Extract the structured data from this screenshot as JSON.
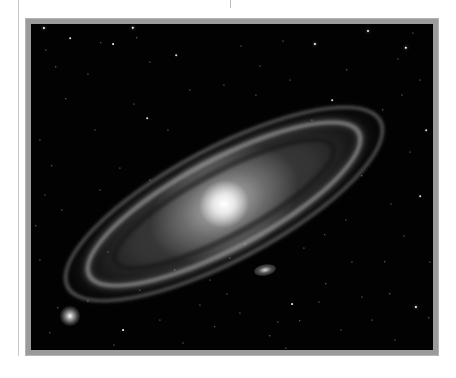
{
  "image": {
    "subject": "Andromeda galaxy (spiral galaxy) with companion galaxies on a starfield",
    "style": "grayscale astrophotograph in gray picture frame",
    "colors": {
      "page_background": "#ffffff",
      "frame": "#9b9b9b",
      "sky": "#020202",
      "galaxy_core": "#ffffff"
    },
    "galaxy": {
      "center": [
        218,
        198
      ],
      "tilt_deg": -28
    },
    "companions": [
      {
        "name": "companion-upper-left",
        "x": 70,
        "y": 316,
        "size": 18
      },
      {
        "name": "companion-below",
        "x": 265,
        "y": 270,
        "w": 18,
        "h": 9
      }
    ],
    "stars": [
      [
        44,
        28,
        2.2
      ],
      [
        70,
        38,
        1.6
      ],
      [
        101,
        43,
        1.4
      ],
      [
        113,
        44,
        1.8
      ],
      [
        133,
        28,
        2.4
      ],
      [
        137,
        38,
        1.4
      ],
      [
        46,
        50,
        1.2
      ],
      [
        315,
        44,
        2.2
      ],
      [
        368,
        31,
        2.0
      ],
      [
        406,
        48,
        2.4
      ],
      [
        413,
        33,
        1.2
      ],
      [
        283,
        41,
        1.2
      ],
      [
        398,
        59,
        1.2
      ],
      [
        56,
        67,
        1.4
      ],
      [
        88,
        74,
        1.2
      ],
      [
        150,
        62,
        1.2
      ],
      [
        176,
        55,
        1.6
      ],
      [
        241,
        46,
        1.0
      ],
      [
        260,
        66,
        1.2
      ],
      [
        347,
        70,
        1.4
      ],
      [
        66,
        99,
        1.4
      ],
      [
        147,
        118,
        1.6
      ],
      [
        168,
        130,
        1.2
      ],
      [
        95,
        130,
        1.2
      ],
      [
        40,
        140,
        1.2
      ],
      [
        52,
        166,
        1.4
      ],
      [
        383,
        110,
        1.4
      ],
      [
        402,
        95,
        1.2
      ],
      [
        420,
        80,
        1.2
      ],
      [
        426,
        130,
        1.6
      ],
      [
        410,
        152,
        1.2
      ],
      [
        362,
        176,
        1.4
      ],
      [
        391,
        204,
        1.2
      ],
      [
        420,
        196,
        1.6
      ],
      [
        404,
        236,
        1.2
      ],
      [
        430,
        262,
        1.2
      ],
      [
        385,
        262,
        1.4
      ],
      [
        352,
        262,
        1.2
      ],
      [
        304,
        248,
        1.2
      ],
      [
        326,
        284,
        1.4
      ],
      [
        362,
        297,
        1.2
      ],
      [
        390,
        294,
        1.4
      ],
      [
        416,
        307,
        2.2
      ],
      [
        429,
        318,
        1.4
      ],
      [
        292,
        304,
        1.8
      ],
      [
        278,
        322,
        1.2
      ],
      [
        300,
        321,
        1.4
      ],
      [
        270,
        336,
        1.4
      ],
      [
        240,
        313,
        1.2
      ],
      [
        215,
        327,
        1.4
      ],
      [
        183,
        343,
        1.2
      ],
      [
        160,
        320,
        1.2
      ],
      [
        123,
        330,
        1.8
      ],
      [
        114,
        345,
        1.2
      ],
      [
        58,
        308,
        1.4
      ],
      [
        50,
        333,
        1.4
      ],
      [
        88,
        301,
        1.2
      ],
      [
        40,
        260,
        1.2
      ],
      [
        36,
        226,
        1.4
      ],
      [
        62,
        210,
        1.2
      ],
      [
        45,
        195,
        1.2
      ],
      [
        140,
        290,
        1.2
      ],
      [
        175,
        270,
        1.4
      ],
      [
        210,
        280,
        1.2
      ],
      [
        230,
        258,
        1.2
      ],
      [
        245,
        244,
        1.2
      ],
      [
        325,
        235,
        1.4
      ],
      [
        346,
        220,
        1.2
      ],
      [
        372,
        320,
        1.2
      ],
      [
        341,
        330,
        1.2
      ],
      [
        395,
        340,
        1.2
      ],
      [
        319,
        302,
        1.2
      ],
      [
        286,
        348,
        1.2
      ],
      [
        227,
        294,
        1.2
      ],
      [
        200,
        305,
        1.2
      ],
      [
        108,
        252,
        1.2
      ],
      [
        134,
        104,
        1.2
      ],
      [
        190,
        90,
        1.2
      ],
      [
        224,
        85,
        1.2
      ],
      [
        256,
        95,
        1.2
      ],
      [
        290,
        80,
        1.2
      ],
      [
        332,
        100,
        1.6
      ],
      [
        312,
        120,
        1.2
      ],
      [
        150,
        180,
        1.2
      ],
      [
        120,
        168,
        1.2
      ],
      [
        100,
        190,
        1.2
      ]
    ]
  }
}
